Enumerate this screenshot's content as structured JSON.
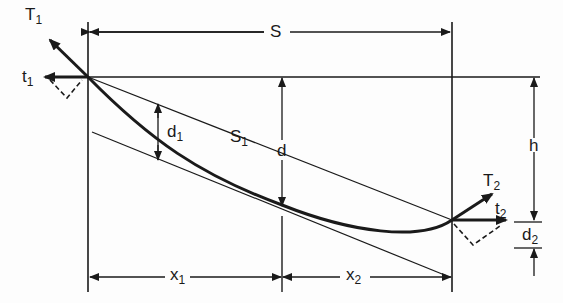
{
  "diagram": {
    "type": "catenary cable geometry diagram",
    "colors": {
      "ink": "#1a1a1a",
      "background": "#fdfdfd"
    },
    "labels": {
      "T1": {
        "base": "T",
        "sub": "1"
      },
      "t1": {
        "base": "t",
        "sub": "1"
      },
      "S": {
        "base": "S"
      },
      "d1": {
        "base": "d",
        "sub": "1"
      },
      "d": {
        "base": "d"
      },
      "S1": {
        "base": "S",
        "sub": "1"
      },
      "h": {
        "base": "h"
      },
      "T2": {
        "base": "T",
        "sub": "2"
      },
      "t2": {
        "base": "t",
        "sub": "2"
      },
      "d2": {
        "base": "d",
        "sub": "2"
      },
      "x1": {
        "base": "x",
        "sub": "1"
      },
      "x2": {
        "base": "x",
        "sub": "2"
      }
    }
  }
}
